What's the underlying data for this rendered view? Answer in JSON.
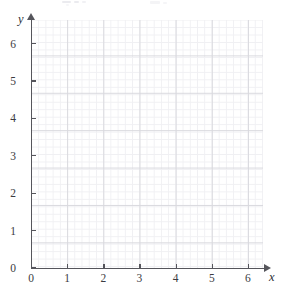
{
  "figure": {
    "background_color": "#ffffff",
    "axis_color": "#56565c",
    "major_grid_color": "#d9d9de",
    "minor_grid_color": "#f0f0f3",
    "label_color": "#3b3b41"
  },
  "chart_data": {
    "type": "scatter",
    "title": "",
    "subtitle": "",
    "xlabel": "x",
    "ylabel": "y",
    "xlim": [
      0,
      6.4
    ],
    "ylim": [
      0,
      6.6
    ],
    "xticks": [
      0,
      1,
      2,
      3,
      4,
      5,
      6
    ],
    "yticks": [
      0,
      1,
      2,
      3,
      4,
      5,
      6
    ],
    "xtick_labels": [
      "0",
      "1",
      "2",
      "3",
      "4",
      "5",
      "6"
    ],
    "ytick_labels": [
      "0",
      "1",
      "2",
      "3",
      "4",
      "5",
      "6"
    ],
    "grid": true,
    "minor_grid": true,
    "minor_ticks_per_unit": 5,
    "legend": null,
    "legend_position": "none",
    "series": [],
    "annotations": []
  },
  "axes": {
    "x_axis_name": "x",
    "y_axis_name": "y"
  },
  "top_artifacts": {
    "description": "faint remnants of cropped text above the figure",
    "visible": true
  }
}
